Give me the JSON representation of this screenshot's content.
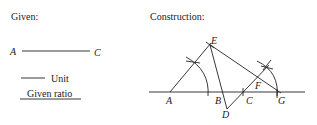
{
  "given": {
    "heading": "Given:",
    "segment_start": "A",
    "segment_end": "C",
    "unit_label": "Unit",
    "ratio_label": "Given ratio"
  },
  "construction": {
    "heading": "Construction:",
    "points": {
      "A": "A",
      "B": "B",
      "C": "C",
      "D": "D",
      "E": "E",
      "F": "F",
      "G": "G"
    }
  },
  "colors": {
    "stroke": "#222222",
    "background": "#ffffff"
  }
}
